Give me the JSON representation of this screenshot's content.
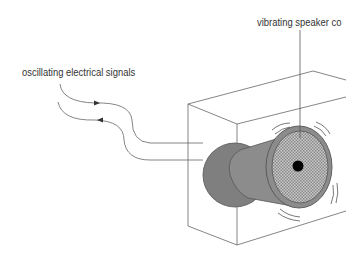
{
  "diagram": {
    "type": "labelled-illustration",
    "labels": {
      "signals": "oscillating electrical signals",
      "speaker_cone": "vibrating speaker co"
    },
    "parts": [
      "speaker-box",
      "magnet",
      "speaker-cone",
      "cone-center",
      "signal-wires",
      "vibration-marks"
    ],
    "colors": {
      "line": "#555555",
      "magnet_fill": "#7a7a7a",
      "cone_fill": "#8a8a8a",
      "cone_face": "#b8b8b8",
      "center_dot": "#000000"
    }
  }
}
